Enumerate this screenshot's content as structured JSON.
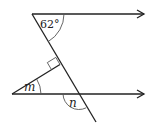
{
  "diagram": {
    "type": "geometry",
    "angles": {
      "top": {
        "label": "62°",
        "value_deg": 62
      },
      "m": {
        "label": "m"
      },
      "n": {
        "label": "n"
      }
    },
    "right_angle_marker": true,
    "parallel_arrows": 2
  }
}
